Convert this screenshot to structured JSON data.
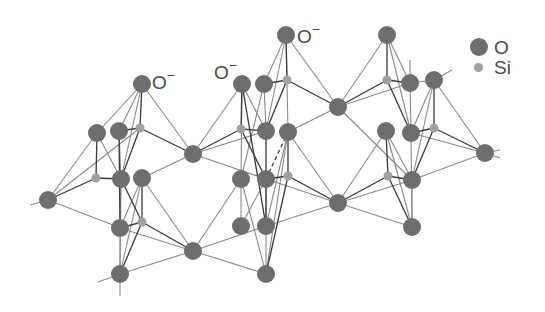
{
  "figure": {
    "colors": {
      "oxygen": "#6e6e6e",
      "silicon": "#a0a0a0",
      "bond_light": "#8a8a8a",
      "bond_dark": "#3a3a3a",
      "text": "#4a4a4a"
    }
  },
  "labels": [
    {
      "text": "O",
      "charge": "−",
      "x": 152,
      "y": 70
    },
    {
      "text": "O",
      "charge": "−",
      "x": 214,
      "y": 60
    },
    {
      "text": "O",
      "charge": "−",
      "x": 297,
      "y": 24
    }
  ],
  "legend": {
    "items": [
      {
        "symbol": "O",
        "label": "O",
        "size": 18,
        "color": "#6e6e6e"
      },
      {
        "symbol": "Si",
        "label": "Si",
        "size": 9,
        "color": "#a0a0a0"
      }
    ]
  }
}
